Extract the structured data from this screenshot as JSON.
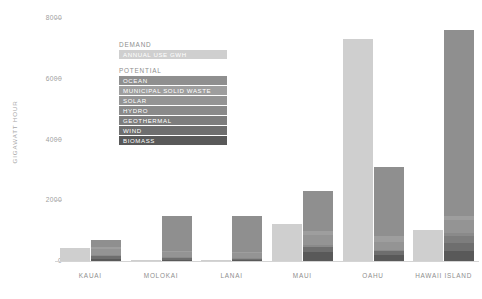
{
  "chart_data": {
    "type": "bar",
    "title": "",
    "subtitle": "",
    "xlabel": "",
    "ylabel": "GIGAWATT HOUR",
    "ylim": [
      0,
      8600
    ],
    "yticks": [
      0,
      2000,
      4000,
      6000,
      8000
    ],
    "ytick_labels": [
      "0",
      "2000",
      "4000",
      "6000",
      "8000"
    ],
    "grid": false,
    "legend_position": "inside-top-center",
    "categories": [
      "KAUAI",
      "MOLOKAI",
      "LANAI",
      "MAUI",
      "OAHU",
      "HAWAII ISLAND"
    ],
    "series": [
      {
        "name": "ANNUAL USE GWH",
        "group": "DEMAND",
        "color": "#cfcfcf",
        "values": [
          420,
          40,
          35,
          1220,
          7330,
          1010
        ]
      },
      {
        "name": "BIOMASS",
        "group": "POTENTIAL",
        "color": "#595959",
        "values": [
          60,
          40,
          30,
          290,
          210,
          330
        ]
      },
      {
        "name": "WIND",
        "group": "POTENTIAL",
        "color": "#6e6e6e",
        "values": [
          90,
          60,
          40,
          180,
          120,
          250
        ]
      },
      {
        "name": "GEOTHERMAL",
        "group": "POTENTIAL",
        "color": "#7d7d7d",
        "values": [
          0,
          0,
          0,
          0,
          0,
          230
        ]
      },
      {
        "name": "HYDRO",
        "group": "POTENTIAL",
        "color": "#8a8a8a",
        "values": [
          40,
          20,
          20,
          60,
          40,
          110
        ]
      },
      {
        "name": "SOLAR",
        "group": "POTENTIAL",
        "color": "#949494",
        "values": [
          200,
          180,
          170,
          340,
          260,
          420
        ]
      },
      {
        "name": "MUNICIPAL SOLID WASTE",
        "group": "POTENTIAL",
        "color": "#9e9e9e",
        "values": [
          60,
          30,
          30,
          130,
          200,
          140
        ]
      },
      {
        "name": "OCEAN",
        "group": "POTENTIAL",
        "color": "#8f8f8f",
        "values": [
          250,
          1170,
          1180,
          1310,
          2280,
          6140
        ]
      }
    ],
    "totals": {
      "demand": [
        420,
        40,
        35,
        1220,
        7330,
        1010
      ],
      "potential": [
        700,
        1500,
        1470,
        2310,
        3110,
        7620
      ]
    }
  },
  "legend": {
    "demand_heading": "DEMAND",
    "potential_heading": "POTENTIAL",
    "demand_items": [
      {
        "label": "ANNUAL USE GWH",
        "color": "#cfcfcf",
        "width": 108
      }
    ],
    "potential_items": [
      {
        "label": "OCEAN",
        "color": "#8f8f8f",
        "width": 108
      },
      {
        "label": "MUNICIPAL SOLID WASTE",
        "color": "#9e9e9e",
        "width": 108
      },
      {
        "label": "SOLAR",
        "color": "#949494",
        "width": 108
      },
      {
        "label": "HYDRO",
        "color": "#8a8a8a",
        "width": 108
      },
      {
        "label": "GEOTHERMAL",
        "color": "#7d7d7d",
        "width": 108
      },
      {
        "label": "WIND",
        "color": "#6e6e6e",
        "width": 108
      },
      {
        "label": "BIOMASS",
        "color": "#595959",
        "width": 108
      }
    ]
  },
  "axis": {
    "y_title": "GIGAWATT HOUR",
    "y_ticks": [
      "8000",
      "6000",
      "4000",
      "2000",
      "0"
    ],
    "x_labels": [
      "KAUAI",
      "MOLOKAI",
      "LANAI",
      "MAUI",
      "OAHU",
      "HAWAII ISLAND"
    ]
  },
  "colors": {
    "background": "#ffffff",
    "axis_line": "#d4d4d4",
    "tick_text": "#9e9e9e",
    "label_text": "#8e8e8e"
  }
}
